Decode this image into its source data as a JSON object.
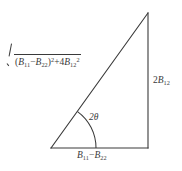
{
  "figure": {
    "type": "right-triangle-diagram",
    "background_color": "#ffffff",
    "line_color": "#3a3a3a",
    "text_color": "#3a3a3a",
    "geometry": {
      "left_vertex": [
        51,
        148
      ],
      "right_angle_vertex": [
        148,
        148
      ],
      "apex": [
        148,
        13
      ],
      "arc_radius": 45,
      "arc_start_angle_deg": 0,
      "arc_end_angle_deg": 54
    },
    "labels": {
      "hypotenuse": {
        "name": "sqrt-expression",
        "radicand_terms": {
          "first_open_paren": "(",
          "first_base": "B",
          "first_sub": "11",
          "minus": "−",
          "second_base": "B",
          "second_sub": "22",
          "first_close_paren": ")",
          "first_power": "2",
          "plus": "+",
          "coefficient": "4",
          "third_base": "B",
          "third_sub": "12",
          "third_power": "2"
        },
        "plain_text": "√((B11−B22)² + 4B12²)"
      },
      "vertical_side": {
        "name": "opposite-side",
        "coefficient": "2",
        "base": "B",
        "sub": "12",
        "plain_text": "2B12"
      },
      "base_side": {
        "name": "adjacent-side",
        "first_base": "B",
        "first_sub": "11",
        "minus": "−",
        "second_base": "B",
        "second_sub": "22",
        "plain_text": "B11−B22"
      },
      "angle": {
        "name": "angle-2theta",
        "coefficient": "2",
        "symbol": "θ",
        "plain_text": "2θ"
      }
    }
  }
}
